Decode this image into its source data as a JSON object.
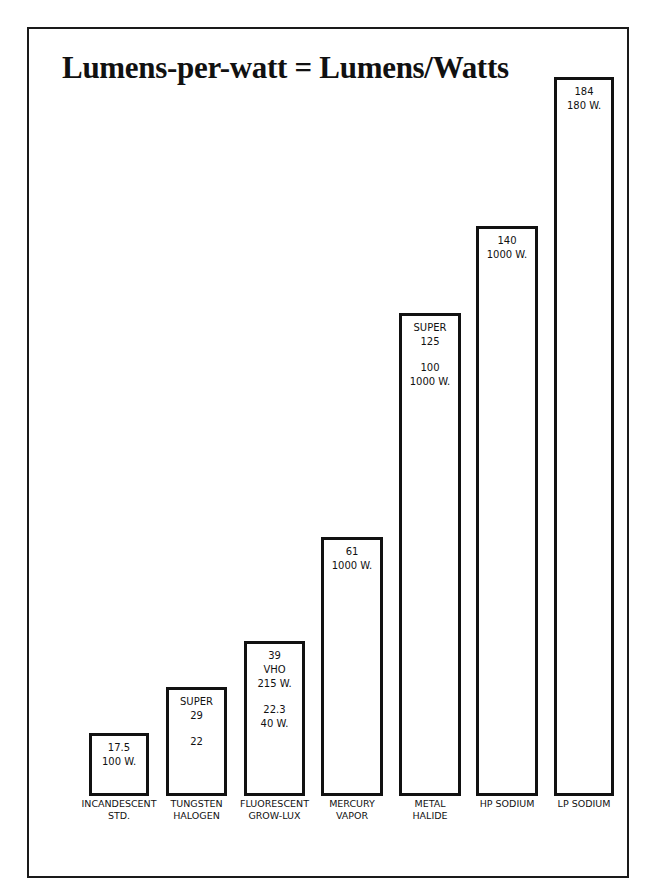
{
  "chart_data": {
    "type": "bar",
    "title": "Lumens-per-watt = Lumens/Watts",
    "xlabel": "",
    "ylabel": "Lumens per watt",
    "ylim": [
      0,
      184
    ],
    "grid": false,
    "legend": null,
    "categories": [
      "INCANDESCENT STD.",
      "TUNGSTEN HALOGEN",
      "FLUORESCENT GROW-LUX",
      "MERCURY VAPOR",
      "METAL HALIDE",
      "HP SODIUM",
      "LP SODIUM"
    ],
    "values": [
      17.5,
      29,
      39,
      61,
      125,
      140,
      184
    ],
    "annotations": [
      [
        "17.5",
        "100 W."
      ],
      [
        "SUPER",
        "29",
        "",
        "22"
      ],
      [
        "39",
        "VHO",
        "215 W.",
        "",
        "22.3",
        "40 W."
      ],
      [
        "61",
        "1000 W."
      ],
      [
        "SUPER",
        "125",
        "",
        "100",
        "1000 W."
      ],
      [
        "140",
        "1000 W."
      ],
      [
        "184",
        "180 W."
      ]
    ],
    "bars": [
      {
        "category_lines": [
          "INCANDESCENT",
          "STD."
        ],
        "value": 17.5,
        "label_lines": [
          "17.5",
          "100 W."
        ],
        "x": 89,
        "w": 60,
        "top": 733
      },
      {
        "category_lines": [
          "TUNGSTEN",
          "HALOGEN"
        ],
        "value": 29,
        "label_lines": [
          "SUPER",
          "29",
          "",
          "22"
        ],
        "x": 166,
        "w": 61,
        "top": 687
      },
      {
        "category_lines": [
          "FLUORESCENT",
          "GROW-LUX"
        ],
        "value": 39,
        "label_lines": [
          "39",
          "VHO",
          "215 W.",
          "",
          "22.3",
          "40 W."
        ],
        "x": 244,
        "w": 61,
        "top": 641
      },
      {
        "category_lines": [
          "MERCURY",
          "VAPOR"
        ],
        "value": 61,
        "label_lines": [
          "61",
          "1000 W."
        ],
        "x": 321,
        "w": 62,
        "top": 537
      },
      {
        "category_lines": [
          "METAL",
          "HALIDE"
        ],
        "value": 125,
        "label_lines": [
          "SUPER",
          "125",
          "",
          "100",
          "1000 W."
        ],
        "x": 399,
        "w": 62,
        "top": 313
      },
      {
        "category_lines": [
          "HP SODIUM"
        ],
        "value": 140,
        "label_lines": [
          "140",
          "1000 W."
        ],
        "x": 476,
        "w": 62,
        "top": 226
      },
      {
        "category_lines": [
          "LP SODIUM"
        ],
        "value": 184,
        "label_lines": [
          "184",
          "180 W."
        ],
        "x": 554,
        "w": 60,
        "top": 77
      }
    ],
    "baseline_y": 796
  }
}
